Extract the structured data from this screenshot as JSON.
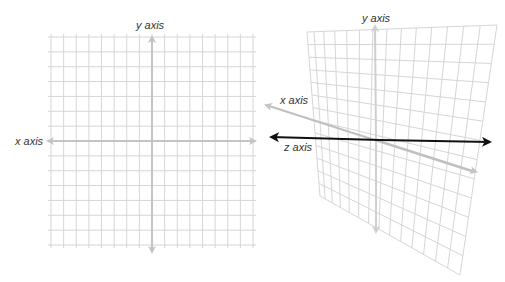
{
  "figure": {
    "left_panel": {
      "name": "2D coordinate plane",
      "labels": {
        "y_axis": "y axis",
        "x_axis": "x axis"
      },
      "grid": {
        "x0": 51,
        "y0": 37,
        "x1": 253,
        "y1": 245,
        "cols": 16,
        "rows": 14
      },
      "colors": {
        "grid": "#d6d6d6",
        "axis": "#c4c4c4"
      }
    },
    "right_panel": {
      "name": "3D perspective plane",
      "labels": {
        "y_axis": "y axis",
        "x_axis": "x axis",
        "z_axis": "z axis"
      },
      "quad": {
        "tl": [
          307,
          32
        ],
        "tr": [
          497,
          25
        ],
        "br": [
          460,
          275
        ],
        "bl": [
          320,
          196
        ]
      },
      "cols": 14,
      "rows": 13,
      "colors": {
        "grid": "#d6d6d6",
        "x_axis": "#c0c0c0",
        "y_axis": "#cfcfcf",
        "z_axis": "#111111"
      }
    },
    "caption": ""
  },
  "chart_data": {
    "type": "diagram",
    "title": "",
    "panels": [
      {
        "view": "2D",
        "axes": [
          "x axis",
          "y axis"
        ]
      },
      {
        "view": "3D",
        "axes": [
          "x axis",
          "y axis",
          "z axis"
        ]
      }
    ]
  }
}
